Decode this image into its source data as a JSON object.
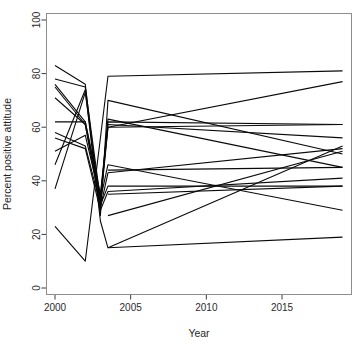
{
  "chart_data": {
    "type": "line",
    "title": "",
    "subtitle": "",
    "xlabel": "Year",
    "ylabel": "Percent positive attitude",
    "xlim": [
      1999.5,
      2019.5
    ],
    "ylim": [
      0,
      100
    ],
    "xticks": [
      2000,
      2005,
      2010,
      2015
    ],
    "yticks": [
      0,
      20,
      40,
      60,
      80,
      100
    ],
    "xtick_labels": [
      "2000",
      "2005",
      "2010",
      "2015"
    ],
    "ytick_labels": [
      "0",
      "20",
      "40",
      "60",
      "80",
      "100"
    ],
    "grid": false,
    "legend": "none",
    "line_color": "#0a0a0a",
    "axis_color": "#3a3a3a",
    "frame_color": "#8d8d8d",
    "background": "#ffffff",
    "series": [
      {
        "name": "line-01",
        "x": [
          2000,
          2002,
          2003,
          2003.5,
          2019
        ],
        "values": [
          83,
          76,
          27,
          70,
          50
        ]
      },
      {
        "name": "line-02",
        "x": [
          2000,
          2002,
          2003,
          2003.5,
          2019
        ],
        "values": [
          78,
          75,
          33,
          60,
          61
        ]
      },
      {
        "name": "line-03",
        "x": [
          2000,
          2002,
          2003,
          2003.5,
          2019
        ],
        "values": [
          76,
          62,
          34,
          61,
          56
        ]
      },
      {
        "name": "line-04",
        "x": [
          2000,
          2002,
          2003,
          2003.5,
          2019
        ],
        "values": [
          75,
          61,
          32,
          63,
          45
        ]
      },
      {
        "name": "line-05",
        "x": [
          2000,
          2002,
          2003,
          2003.5,
          2019
        ],
        "values": [
          71,
          61,
          30,
          43,
          52
        ]
      },
      {
        "name": "line-06",
        "x": [
          2000,
          2002,
          2003,
          2003.5,
          2019
        ],
        "values": [
          62,
          62,
          35,
          62,
          61
        ]
      },
      {
        "name": "line-07",
        "x": [
          2000,
          2002,
          2003,
          2003.5,
          2019
        ],
        "values": [
          58,
          53,
          31,
          38,
          38
        ]
      },
      {
        "name": "line-08",
        "x": [
          2000,
          2002,
          2003,
          2003.5,
          2019
        ],
        "values": [
          56,
          52,
          29,
          36,
          41
        ]
      },
      {
        "name": "line-09",
        "x": [
          2000,
          2002,
          2003,
          2003.5,
          2019
        ],
        "values": [
          51,
          57,
          33,
          46,
          29
        ]
      },
      {
        "name": "line-10",
        "x": [
          2000,
          2002,
          2003,
          2003.5,
          2019
        ],
        "values": [
          46,
          74,
          25,
          15,
          19
        ]
      },
      {
        "name": "line-11",
        "x": [
          2000,
          2002,
          2003,
          2003.5,
          2019
        ],
        "values": [
          37,
          73,
          31,
          60,
          77
        ]
      },
      {
        "name": "line-12",
        "x": [
          2000,
          2002,
          2003.5,
          2019
        ],
        "values": [
          23,
          10,
          79,
          81
        ]
      },
      {
        "name": "line-13",
        "x": [
          2003.5,
          2019
        ],
        "values": [
          27,
          51
        ]
      },
      {
        "name": "line-14",
        "x": [
          2003.5,
          2019
        ],
        "values": [
          15,
          53
        ]
      },
      {
        "name": "line-15",
        "x": [
          2003.5,
          2019
        ],
        "values": [
          44,
          45
        ]
      },
      {
        "name": "line-16",
        "x": [
          2003.5,
          2019
        ],
        "values": [
          35,
          38
        ]
      }
    ]
  }
}
